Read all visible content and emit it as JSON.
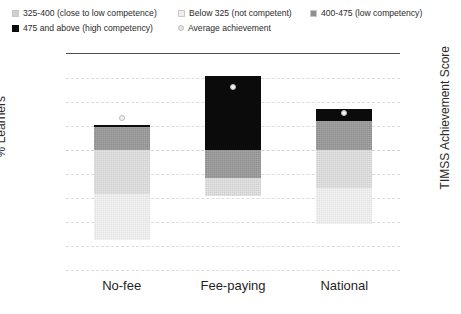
{
  "chart_data": {
    "type": "bar",
    "title": "",
    "subtitle": "",
    "xlabel": "",
    "ylabel": "% Learners",
    "y2label": "TIMSS Achievement Score",
    "categories": [
      "No-fee",
      "Fee-paying",
      "National"
    ],
    "ylim": [
      -100,
      80
    ],
    "yticks": [
      "80%",
      "60%",
      "40%",
      "20%",
      "0%",
      "-20%",
      "-40%",
      "-60%",
      "-80%",
      "-100%"
    ],
    "ytick_values": [
      80,
      60,
      40,
      20,
      0,
      -20,
      -40,
      -60,
      -80,
      -100
    ],
    "y2lim": [
      0,
      500
    ],
    "y2ticks": [
      "500",
      "450",
      "400",
      "350",
      "300",
      "250",
      "200",
      "150",
      "100",
      "50",
      "0"
    ],
    "y2tick_values": [
      500,
      450,
      400,
      350,
      300,
      250,
      200,
      150,
      100,
      50,
      0
    ],
    "grid": true,
    "legend_position": "top",
    "stacked": true,
    "series": [
      {
        "name": "325-400 (close to low competence)",
        "key": "mid",
        "color": "#cfcfcf",
        "values": [
          -37,
          -15,
          -32
        ]
      },
      {
        "name": "Below 325 (not competent)",
        "key": "light",
        "color": "#e2e2e2",
        "values": [
          -38,
          0,
          -30
        ]
      },
      {
        "name": "400-475 (low competency)",
        "key": "dark",
        "color": "#8f8f8f",
        "values": [
          19,
          -23,
          24
        ]
      },
      {
        "name": "475 and above (high competency)",
        "key": "black",
        "color": "#0b0b0b",
        "values": [
          2,
          62,
          10
        ]
      }
    ],
    "overlay": {
      "name": "Average achievement",
      "marker": "circle",
      "color": "#f2f2f2",
      "values": [
        352,
        424,
        364
      ]
    },
    "bars": [
      {
        "category": "No-fee",
        "black_top": 21,
        "black_bottom": 19,
        "dark_top": 19,
        "dark_bottom": 0,
        "mid_top": 0,
        "mid_bottom": -37,
        "light_top": -37,
        "light_bottom": -75,
        "avg_score": 352
      },
      {
        "category": "Fee-paying",
        "black_top": 62,
        "black_bottom": 0,
        "dark_top": 0,
        "dark_bottom": -23,
        "mid_top": -23,
        "mid_bottom": -38,
        "light_top": -38,
        "light_bottom": -38,
        "avg_score": 424
      },
      {
        "category": "National",
        "black_top": 34,
        "black_bottom": 24,
        "dark_top": 24,
        "dark_bottom": 0,
        "mid_top": 0,
        "mid_bottom": -32,
        "light_top": -32,
        "light_bottom": -62,
        "avg_score": 364
      }
    ]
  },
  "legend": {
    "items": [
      {
        "label": "325-400 (close to low competence)",
        "swatch": "mid",
        "marker": "square"
      },
      {
        "label": "Below 325 (not competent)",
        "swatch": "light",
        "marker": "square"
      },
      {
        "label": "400-475 (low competency)",
        "swatch": "dark",
        "marker": "square"
      },
      {
        "label": "475 and above (high competency)",
        "swatch": "black",
        "marker": "square"
      },
      {
        "label": "Average achievement",
        "swatch": "avg",
        "marker": "circle"
      }
    ]
  }
}
